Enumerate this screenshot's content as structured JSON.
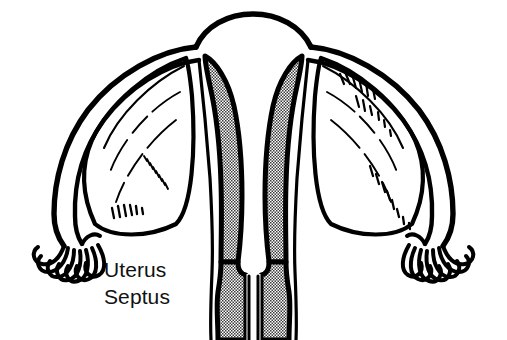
{
  "figure": {
    "title": "Uterus Septus",
    "view": "anterior coronal cross-section",
    "width": 507,
    "height": 340,
    "background_color": "#ffffff",
    "ink_color": "#000000",
    "stipple_color": "#8a8a8a"
  },
  "labels": [
    {
      "id": "uterus",
      "text": "Uterus",
      "x": 104,
      "y": 259
    },
    {
      "id": "septus",
      "text": "Septus",
      "x": 104,
      "y": 286
    }
  ],
  "structures": [
    {
      "name": "uterine-fundus",
      "description": "broad smooth dome at the top of the uterine body"
    },
    {
      "name": "uterine-body-outline",
      "description": "outer myometrial wall descending from the fundus to the cervix"
    },
    {
      "name": "left-endometrial-cavity",
      "description": "stippled left hemicavity running from the left horn down to the cervix",
      "fill": "stipple"
    },
    {
      "name": "right-endometrial-cavity",
      "description": "stippled right hemicavity running from the right horn down to the cervix",
      "fill": "stipple"
    },
    {
      "name": "uterine-septum",
      "description": "white muscular wedge dividing the two endometrial cavities in the midline",
      "fill": "white"
    },
    {
      "name": "cervical-canal-left",
      "description": "stippled left cervical compartment",
      "fill": "stipple"
    },
    {
      "name": "cervical-canal-right",
      "description": "stippled right cervical compartment",
      "fill": "stipple"
    },
    {
      "name": "left-fallopian-tube",
      "description": "tube sweeping laterally and downward from the left cornu"
    },
    {
      "name": "right-fallopian-tube",
      "description": "tube sweeping laterally and downward from the right cornu"
    },
    {
      "name": "left-fimbriae",
      "description": "finger-like fringe at the distal end of the left tube"
    },
    {
      "name": "right-fimbriae",
      "description": "finger-like fringe at the distal end of the right tube"
    },
    {
      "name": "left-broad-ligament",
      "description": "membranous sheet between the left tube and the uterus, shown with hatch marks"
    },
    {
      "name": "right-broad-ligament",
      "description": "membranous sheet between the right tube and the uterus, shown with hatch marks"
    }
  ]
}
